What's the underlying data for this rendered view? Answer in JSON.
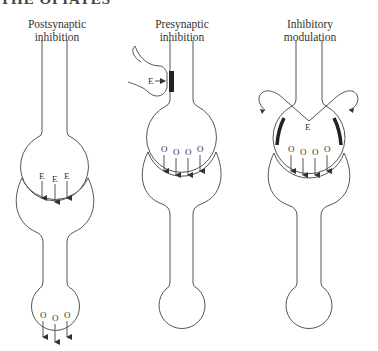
{
  "header": {
    "fragment": "THE OPIATES"
  },
  "panels": [
    {
      "id": "postsynaptic",
      "label_line1": "Postsynaptic",
      "label_line2": "inhibition",
      "synapse_top_labels": [
        "E",
        "E",
        "E"
      ],
      "terminal_labels": [
        "O",
        "O",
        "O"
      ]
    },
    {
      "id": "presynaptic",
      "label_line1": "Presynaptic",
      "label_line2": "inhibition",
      "presynaptic_label": "E",
      "synapse_labels": [
        "O",
        "O",
        "O",
        "O"
      ]
    },
    {
      "id": "inhibitory-modulation",
      "label_line1": "Inhibitory",
      "label_line2": "modulation",
      "modulator_label": "E",
      "synapse_labels": [
        "O",
        "O",
        "O",
        "O"
      ]
    }
  ]
}
